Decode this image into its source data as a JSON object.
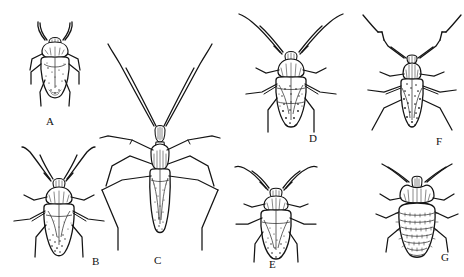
{
  "plate": {
    "background_color": "#ffffff",
    "ink_color": "#141414",
    "description": "Black-and-white scientific line drawings of seven true bugs (Hemiptera), dorsal view, arranged in two rows and labeled A through G",
    "style": "pen-and-ink stipple illustration",
    "figure_count": 7
  },
  "figures": [
    {
      "id": "A",
      "label": "A",
      "name": "figure-a-shield-bug",
      "common_name": "broad oval shield-shaped bug",
      "row": "top",
      "column": 1,
      "label_x": 46,
      "label_y": 116,
      "antennae": "short, curved forward",
      "body_shape": "broad rounded oval",
      "relative_size": "small"
    },
    {
      "id": "B",
      "label": "B",
      "name": "figure-b-plant-bug",
      "common_name": "oval plant bug with long antennae",
      "row": "bottom",
      "column": 1,
      "label_x": 92,
      "label_y": 256,
      "antennae": "long, slender, swept back",
      "body_shape": "elongate oval",
      "relative_size": "medium"
    },
    {
      "id": "C",
      "label": "C",
      "name": "figure-c-assassin-bug",
      "common_name": "slender long-legged assassin bug",
      "row": "bottom",
      "column": 2,
      "label_x": 154,
      "label_y": 255,
      "antennae": "very long, thread-like, V-shaped",
      "body_shape": "narrow elongate",
      "relative_size": "large"
    },
    {
      "id": "D",
      "label": "D",
      "name": "figure-d-mottled-plant-bug",
      "common_name": "mottled plant bug with curved antennae",
      "row": "top",
      "column": 2,
      "label_x": 309,
      "label_y": 133,
      "antennae": "long, curved outward",
      "body_shape": "elongate oval, pointed apex",
      "relative_size": "medium"
    },
    {
      "id": "E",
      "label": "E",
      "name": "figure-e-oval-bug",
      "common_name": "stout oval bug with short legs",
      "row": "bottom",
      "column": 3,
      "label_x": 269,
      "label_y": 259,
      "antennae": "moderate, angled outward",
      "body_shape": "broad oval",
      "relative_size": "medium"
    },
    {
      "id": "F",
      "label": "F",
      "name": "figure-f-elbowed-antennae-bug",
      "common_name": "bug with strongly elbowed antennae",
      "row": "top",
      "column": 3,
      "label_x": 436,
      "label_y": 136,
      "antennae": "elbowed / geniculate",
      "body_shape": "narrow elongate oval, heavily stippled",
      "relative_size": "medium"
    },
    {
      "id": "G",
      "label": "G",
      "name": "figure-g-bed-bug",
      "common_name": "bed bug with segmented abdomen",
      "row": "bottom",
      "column": 4,
      "label_x": 441,
      "label_y": 252,
      "antennae": "four-segmented, spreading",
      "body_shape": "flat rounded oval with transverse segments",
      "relative_size": "medium"
    }
  ]
}
